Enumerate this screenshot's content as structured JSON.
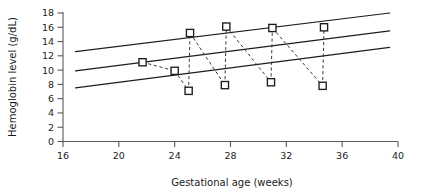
{
  "chart_data": {
    "type": "line",
    "title": "",
    "xlabel": "Gestational age (weeks)",
    "ylabel": "Hemoglobin level (g/dL)",
    "xlim": [
      16,
      40
    ],
    "ylim": [
      0,
      18
    ],
    "xticks": [
      16,
      20,
      24,
      28,
      32,
      36,
      40
    ],
    "yticks": [
      0,
      2,
      4,
      6,
      8,
      10,
      12,
      14,
      16,
      18
    ],
    "grid": false,
    "legend": "none",
    "reference_lines": [
      {
        "name": "upper-reference-line",
        "x": [
          16.9,
          39.4
        ],
        "y": [
          12.6,
          18.0
        ]
      },
      {
        "name": "middle-reference-line",
        "x": [
          16.9,
          39.4
        ],
        "y": [
          9.9,
          15.5
        ]
      },
      {
        "name": "lower-reference-line",
        "x": [
          16.9,
          39.4
        ],
        "y": [
          7.5,
          13.2
        ]
      }
    ],
    "series": [
      {
        "name": "patient-trajectory",
        "style": "dashed",
        "marker": "open-square",
        "points": [
          {
            "x": 21.7,
            "y": 11.1
          },
          {
            "x": 24.0,
            "y": 9.9
          },
          {
            "x": 25.0,
            "y": 7.1
          },
          {
            "x": 25.1,
            "y": 15.2
          },
          {
            "x": 27.6,
            "y": 7.9
          },
          {
            "x": 27.7,
            "y": 16.1
          },
          {
            "x": 30.9,
            "y": 8.3
          },
          {
            "x": 31.0,
            "y": 15.9
          },
          {
            "x": 34.6,
            "y": 7.8
          },
          {
            "x": 34.7,
            "y": 16.0
          }
        ],
        "segments": [
          [
            {
              "x": 21.7,
              "y": 11.1
            },
            {
              "x": 24.0,
              "y": 9.9
            }
          ],
          [
            {
              "x": 24.0,
              "y": 9.9
            },
            {
              "x": 25.0,
              "y": 7.1
            }
          ],
          [
            {
              "x": 25.0,
              "y": 7.1
            },
            {
              "x": 25.1,
              "y": 15.2
            }
          ],
          [
            {
              "x": 25.1,
              "y": 15.2
            },
            {
              "x": 27.6,
              "y": 7.9
            }
          ],
          [
            {
              "x": 27.6,
              "y": 7.9
            },
            {
              "x": 27.7,
              "y": 16.1
            }
          ],
          [
            {
              "x": 27.7,
              "y": 16.1
            },
            {
              "x": 30.9,
              "y": 8.3
            }
          ],
          [
            {
              "x": 30.9,
              "y": 8.3
            },
            {
              "x": 31.0,
              "y": 15.9
            }
          ],
          [
            {
              "x": 31.0,
              "y": 15.9
            },
            {
              "x": 34.6,
              "y": 7.8
            }
          ],
          [
            {
              "x": 34.6,
              "y": 7.8
            },
            {
              "x": 34.7,
              "y": 16.0
            }
          ]
        ]
      }
    ],
    "colors": {
      "reference_line": "#1d1d1d",
      "series_line": "#3a3a3a",
      "marker_stroke": "#1d1d1d",
      "marker_fill": "#ffffff",
      "axis": "#555a5e",
      "text": "#232323",
      "background": "#ffffff"
    }
  }
}
